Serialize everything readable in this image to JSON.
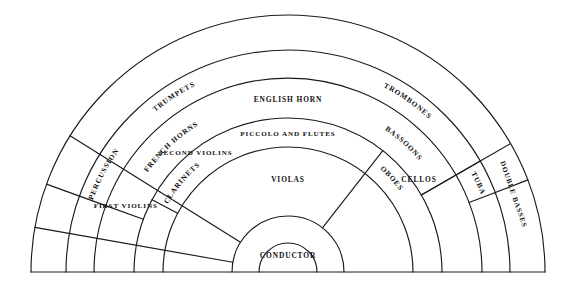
{
  "diagram": {
    "type": "fan-seating-chart",
    "center": {
      "x": 288,
      "y": 272
    },
    "baseline_y": 272,
    "stroke_color": "#1a1a1a",
    "background_color": "#ffffff",
    "ring_radii": [
      29,
      56,
      125,
      154,
      194,
      222,
      257
    ],
    "sections": [
      {
        "id": "conductor",
        "label": "CONDUCTOR",
        "ring": 0,
        "angle_deg": 90,
        "radius": 16,
        "orientation": "horizontal"
      },
      {
        "id": "violas",
        "label": "VIOLAS",
        "ring": 1,
        "angle_deg": 90,
        "radius": 92,
        "orientation": "horizontal"
      },
      {
        "id": "first-violins",
        "label": "FIRST VIOLINS",
        "ring": 1,
        "angle_deg": 158,
        "radius": 175,
        "orientation": "horizontal"
      },
      {
        "id": "second-violins",
        "label": "SECOND VIOLINS",
        "ring": 1,
        "angle_deg": 128,
        "radius": 150,
        "orientation": "horizontal"
      },
      {
        "id": "cellos",
        "label": "CELLOS",
        "ring": 1,
        "angle_deg": 35,
        "radius": 160,
        "orientation": "horizontal"
      },
      {
        "id": "double-basses",
        "label": "DOUBLE BASSES",
        "ring": 2,
        "angle_deg": 19,
        "radius": 238,
        "orientation": "radial"
      },
      {
        "id": "piccolo-flutes",
        "label": "PICCOLO AND FLUTES",
        "ring": 3,
        "angle_deg": 90,
        "radius": 138,
        "orientation": "horizontal"
      },
      {
        "id": "english-horn",
        "label": "ENGLISH HORN",
        "ring": 4,
        "angle_deg": 90,
        "radius": 172,
        "orientation": "horizontal"
      },
      {
        "id": "oboes",
        "label": "OBOES",
        "ring": 3,
        "angle_deg": 42,
        "radius": 138,
        "orientation": "arc"
      },
      {
        "id": "clarinets",
        "label": "CLARINETS",
        "ring": 3,
        "angle_deg": 140,
        "radius": 138,
        "orientation": "arc"
      },
      {
        "id": "bassoons",
        "label": "BASSOONS",
        "ring": 4,
        "angle_deg": 48,
        "radius": 172,
        "orientation": "arc"
      },
      {
        "id": "french-horns",
        "label": "FRENCH HORNS",
        "ring": 4,
        "angle_deg": 133,
        "radius": 172,
        "orientation": "arc"
      },
      {
        "id": "trumpets",
        "label": "TRUMPETS",
        "ring": 5,
        "angle_deg": 123,
        "radius": 208,
        "orientation": "arc"
      },
      {
        "id": "trombones",
        "label": "TROMBONES",
        "ring": 5,
        "angle_deg": 55,
        "radius": 208,
        "orientation": "arc"
      },
      {
        "id": "tuba",
        "label": "TUBA",
        "ring": 5,
        "angle_deg": 25,
        "radius": 208,
        "orientation": "arc"
      },
      {
        "id": "percussion",
        "label": "PERCUSSION",
        "ring": 5,
        "angle_deg": 152,
        "radius": 208,
        "orientation": "arc"
      }
    ],
    "arcs": [
      {
        "id": "outer-arc",
        "radius": 257,
        "start_deg": 0,
        "end_deg": 180
      },
      {
        "id": "basses-inner-arc",
        "radius": 222,
        "start_deg": 0,
        "end_deg": 180
      },
      {
        "id": "brass-inner-arc",
        "radius": 194,
        "start_deg": 0,
        "end_deg": 180
      },
      {
        "id": "woodwind-outer-arc",
        "radius": 154,
        "start_deg": 0,
        "end_deg": 180
      },
      {
        "id": "woodwind-inner-arc",
        "radius": 125,
        "start_deg": 0,
        "end_deg": 180
      },
      {
        "id": "strings-inner-arc",
        "radius": 56,
        "start_deg": 0,
        "end_deg": 180
      },
      {
        "id": "conductor-arc",
        "radius": 29,
        "start_deg": 0,
        "end_deg": 180
      }
    ],
    "radial_dividers": [
      {
        "id": "percussion-divider",
        "angle_deg": 160,
        "r_inner": 194,
        "r_outer": 257
      },
      {
        "id": "tuba-outer-divider",
        "angle_deg": 21,
        "r_inner": 194,
        "r_outer": 257
      },
      {
        "id": "trumpet-horn-divider",
        "angle_deg": 160,
        "r_inner": 154,
        "r_outer": 194
      },
      {
        "id": "tuba-inner-divider",
        "angle_deg": 30,
        "r_inner": 154,
        "r_outer": 222
      },
      {
        "id": "basses-divider",
        "angle_deg": 30,
        "r_inner": 154,
        "r_outer": 257
      },
      {
        "id": "clarinet-divider",
        "angle_deg": 152,
        "r_inner": 125,
        "r_outer": 154
      },
      {
        "id": "violin-divider",
        "angle_deg": 148,
        "r_inner": 56,
        "r_outer": 257
      },
      {
        "id": "viola-cello-divider",
        "angle_deg": 52,
        "r_inner": 56,
        "r_outer": 154
      },
      {
        "id": "violins-split",
        "angle_deg": 170,
        "r_inner": 56,
        "r_outer": 257
      }
    ]
  }
}
